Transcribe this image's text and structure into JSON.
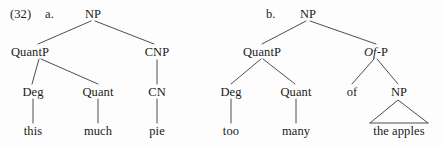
{
  "figure": {
    "example_number": "(32)",
    "line_color": "#3a3a3a",
    "text_color": "#1a1a1a",
    "background_color": "#fdfdfd"
  },
  "trees": [
    {
      "sublabel": "a.",
      "root": "NP",
      "nodes": {
        "quantp": "QuantP",
        "cnp": "CNP",
        "deg": "Deg",
        "quant": "Quant",
        "cn": "CN"
      },
      "terminals": {
        "deg_word": "this",
        "quant_word": "much",
        "cn_word": "pie"
      }
    },
    {
      "sublabel": "b.",
      "root": "NP",
      "nodes": {
        "quantp": "QuantP",
        "ofp_italic": "Of",
        "ofp_rest": "-P",
        "deg": "Deg",
        "quant": "Quant",
        "p_head": "of",
        "np": "NP"
      },
      "terminals": {
        "deg_word": "too",
        "quant_word": "many",
        "np_phrase": "the apples"
      }
    }
  ]
}
